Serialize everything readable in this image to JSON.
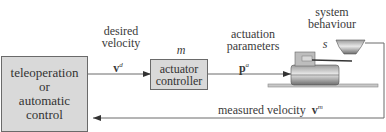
{
  "diagram": {
    "blocks": {
      "controller_source": {
        "lines": [
          "teleoperation",
          "or",
          "automatic",
          "control"
        ]
      },
      "actuator_controller": {
        "lines": [
          "actuator",
          "controller"
        ],
        "symbol": "m"
      }
    },
    "signals": {
      "desired_velocity": {
        "label_lines": [
          "desired",
          "velocity"
        ],
        "symbol": "v",
        "superscript": "d"
      },
      "actuation_parameters": {
        "label_lines": [
          "actuation",
          "parameters"
        ],
        "symbol": "p",
        "superscript": "a"
      },
      "measured_velocity": {
        "label": "measured velocity",
        "symbol": "v",
        "superscript": "m"
      }
    },
    "system": {
      "label_lines": [
        "system",
        "behaviour"
      ],
      "symbol": "s"
    },
    "colors": {
      "block_fill": "#d9d9d9",
      "block_border": "#6a6a6a",
      "line": "#6a6a6a"
    }
  }
}
